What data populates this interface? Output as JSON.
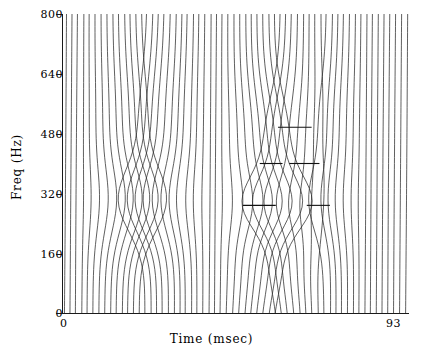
{
  "chart_data": {
    "type": "line",
    "title": "",
    "xlabel": "Time (msec)",
    "ylabel": "Freq (Hz)",
    "xlim": [
      0,
      93
    ],
    "ylim": [
      0,
      800
    ],
    "xticks": [
      0,
      93
    ],
    "xticklabels": [
      "0",
      "93"
    ],
    "yticks": [
      0,
      160,
      320,
      480,
      640,
      800
    ],
    "yticklabels": [
      "0",
      "160",
      "320",
      "480",
      "640",
      "800"
    ],
    "grid": false,
    "legend": null,
    "annotations": [
      {
        "label": "marker-1",
        "x_msec": 58.0,
        "y_hz": 497,
        "x_span_msec": [
          57.9,
          66.9
        ],
        "y_value": 497
      },
      {
        "label": "marker-2",
        "x_msec": 53.0,
        "y_hz": 400,
        "x_span_msec": [
          53.0,
          59.1
        ],
        "y_value": 400
      },
      {
        "label": "marker-3",
        "x_msec": 61.0,
        "y_hz": 400,
        "x_span_msec": [
          60.9,
          69.0
        ],
        "y_value": 400
      },
      {
        "label": "marker-4",
        "x_msec": 48.5,
        "y_hz": 288,
        "x_span_msec": [
          48.5,
          57.3
        ],
        "y_value": 288
      },
      {
        "label": "marker-5",
        "x_msec": 65.6,
        "y_hz": 288,
        "x_span_msec": [
          65.6,
          71.8
        ],
        "y_value": 288
      }
    ],
    "series": [
      {
        "name": "trace-1",
        "x": [
          0,
          14,
          20,
          24,
          30,
          46,
          54,
          60,
          66,
          80,
          93
        ],
        "values": [
          800,
          800,
          800,
          800,
          800,
          800,
          800,
          800,
          800,
          800,
          800
        ]
      },
      {
        "name": "trace-bundle",
        "note": "60 harmonic trajectories spanning 0-800 Hz across 0-93 msec"
      }
    ]
  },
  "axes": {
    "y_title": "Freq (Hz)",
    "x_title": "Time (msec)",
    "y_labels": [
      "800",
      "640",
      "480",
      "320",
      "160",
      "0"
    ],
    "x_label_min": "0",
    "x_label_max": "93"
  },
  "style": {
    "line_color": "#2b2b2b",
    "axis_color": "#1a1a1a",
    "background": "#ffffff"
  }
}
